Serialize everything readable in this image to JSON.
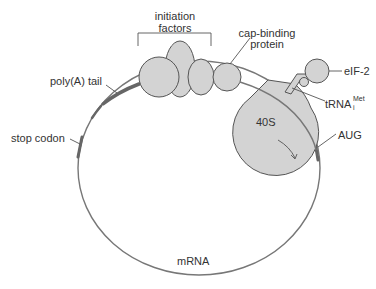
{
  "figure": {
    "type": "mRNA translation initiation schematic",
    "colors": {
      "component_fill": "#d3d3d3",
      "outline": "#555555",
      "mrna_line": "#777777",
      "highlight_segments": "#666666",
      "text": "#333333"
    },
    "labels": {
      "initiation_factors_line1": "initiation",
      "initiation_factors_line2": "factors",
      "cap_binding_line1": "cap-binding",
      "cap_binding_line2": "protein",
      "eif2": "eIF-2",
      "trna_base": "tRNA",
      "trna_sup": "Met",
      "trna_sub": "i",
      "aug": "AUG",
      "ribosome_40s": "40S",
      "poly_a_tail": "poly(A) tail",
      "stop_codon": "stop codon",
      "mrna": "mRNA"
    }
  }
}
